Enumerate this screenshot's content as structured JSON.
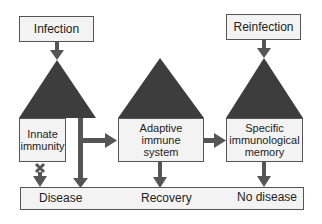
{
  "diagram": {
    "inputs": {
      "infection": "Infection",
      "reinfection": "Reinfection"
    },
    "stages": {
      "innate": "Innate immunity",
      "adaptive": "Adaptive immune system",
      "memory": "Specific immunological memory"
    },
    "outcomes": {
      "disease": "Disease",
      "recovery": "Recovery",
      "no_disease": "No disease"
    },
    "colors": {
      "triangle": "#3d3d3d",
      "arrow": "#555555",
      "box_fill": "#f3f3f3",
      "box_border": "#555555"
    }
  }
}
